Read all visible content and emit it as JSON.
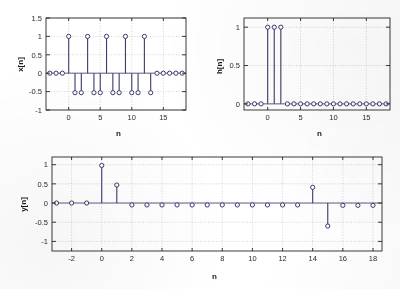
{
  "figure": {
    "background": "#ffffff",
    "stem_color": "#3b3b6d",
    "marker_face": "#ffffff",
    "axis_color": "#262626",
    "grid_color": "#b9b9b9"
  },
  "panels": [
    {
      "id": "x-panel",
      "ylabel": "x[n]",
      "xlabel": "n"
    },
    {
      "id": "h-panel",
      "ylabel": "h[n]",
      "xlabel": "n"
    },
    {
      "id": "y-panel",
      "ylabel": "y[n]",
      "xlabel": "n"
    }
  ],
  "chart_data": [
    {
      "type": "scatter",
      "plot_style": "stem",
      "name": "x[n]",
      "title": "",
      "xlabel": "n",
      "ylabel": "x[n]",
      "xlim": [
        -3.6,
        18.6
      ],
      "ylim": [
        -1,
        1.5
      ],
      "xticks": [
        0,
        5,
        10,
        15
      ],
      "xticklabels": [
        "0",
        "5",
        "10",
        "15"
      ],
      "yticks": [
        -1,
        -0.5,
        0,
        0.5,
        1,
        1.5
      ],
      "yticklabels": [
        "-1",
        "-0.5",
        "0",
        "0.5",
        "1",
        "1.5"
      ],
      "grid": true,
      "legend": "none",
      "x": [
        -3,
        -2,
        -1,
        0,
        1,
        2,
        3,
        4,
        5,
        6,
        7,
        8,
        9,
        10,
        11,
        12,
        13,
        14,
        15,
        16,
        17,
        18
      ],
      "values": [
        0,
        0,
        0,
        1,
        -0.53,
        -0.53,
        1,
        -0.53,
        -0.53,
        1,
        -0.53,
        -0.53,
        1,
        -0.53,
        -0.53,
        1,
        -0.53,
        0,
        0,
        0,
        0,
        0
      ]
    },
    {
      "type": "scatter",
      "plot_style": "stem",
      "name": "h[n]",
      "title": "",
      "xlabel": "n",
      "ylabel": "h[n]",
      "xlim": [
        -3.6,
        18.6
      ],
      "ylim": [
        -0.08,
        1.12
      ],
      "xticks": [
        0,
        5,
        10,
        15
      ],
      "xticklabels": [
        "0",
        "5",
        "10",
        "15"
      ],
      "yticks": [
        0,
        0.5,
        1
      ],
      "yticklabels": [
        "0",
        "0.5",
        "1"
      ],
      "grid": true,
      "legend": "none",
      "x": [
        -3,
        -2,
        -1,
        0,
        1,
        2,
        3,
        4,
        5,
        6,
        7,
        8,
        9,
        10,
        11,
        12,
        13,
        14,
        15,
        16,
        17,
        18
      ],
      "values": [
        0,
        0,
        0,
        1,
        1,
        1,
        0,
        0,
        0,
        0,
        0,
        0,
        0,
        0,
        0,
        0,
        0,
        0,
        0,
        0,
        0,
        0
      ]
    },
    {
      "type": "scatter",
      "plot_style": "stem",
      "name": "y[n]",
      "title": "",
      "xlabel": "n",
      "ylabel": "y[n]",
      "xlim": [
        -3.3,
        18.6
      ],
      "ylim": [
        -1.25,
        1.2
      ],
      "xticks": [
        -2,
        0,
        2,
        4,
        6,
        8,
        10,
        12,
        14,
        16,
        18
      ],
      "xticklabels": [
        "-2",
        "0",
        "2",
        "4",
        "6",
        "8",
        "10",
        "12",
        "14",
        "16",
        "18"
      ],
      "yticks": [
        -1,
        -0.5,
        0,
        0.5,
        1
      ],
      "yticklabels": [
        "-1",
        "-0.5",
        "0",
        "0.5",
        "1"
      ],
      "grid": true,
      "legend": "none",
      "x": [
        -3,
        -2,
        -1,
        0,
        1,
        2,
        3,
        4,
        5,
        6,
        7,
        8,
        9,
        10,
        11,
        12,
        13,
        14,
        15,
        16,
        17,
        18
      ],
      "values": [
        0,
        0,
        0,
        0.98,
        0.47,
        -0.05,
        -0.05,
        -0.05,
        -0.05,
        -0.05,
        -0.05,
        -0.05,
        -0.05,
        -0.05,
        -0.05,
        -0.05,
        -0.05,
        0.41,
        -0.6,
        -0.06,
        -0.06,
        -0.06
      ]
    }
  ]
}
